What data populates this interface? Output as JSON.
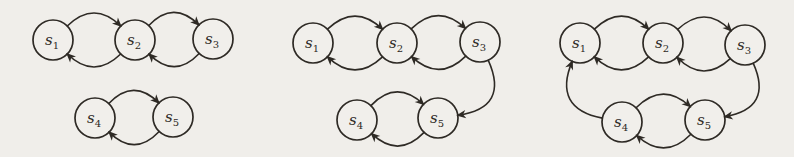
{
  "canvas": {
    "width": 794,
    "height": 157,
    "paper_color": "#f0eeea",
    "node_fill": "#f1efeb",
    "ink_color": "#2e2a25",
    "node_radius": 20,
    "edge_stroke_width": 1.6,
    "node_stroke_width": 1.7
  },
  "diagrams": [
    {
      "name": "graph-left",
      "nodes": [
        {
          "id": "s1",
          "label": "s",
          "sub": "1",
          "x": 53,
          "y": 40
        },
        {
          "id": "s2",
          "label": "s",
          "sub": "2",
          "x": 135,
          "y": 40
        },
        {
          "id": "s3",
          "label": "s",
          "sub": "3",
          "x": 213,
          "y": 39
        },
        {
          "id": "s4",
          "label": "s",
          "sub": "4",
          "x": 95,
          "y": 118
        },
        {
          "id": "s5",
          "label": "s",
          "sub": "5",
          "x": 173,
          "y": 117
        }
      ],
      "edges": [
        {
          "from": "s1",
          "to": "s2",
          "bend": 40
        },
        {
          "from": "s2",
          "to": "s1",
          "bend": 40
        },
        {
          "from": "s2",
          "to": "s3",
          "bend": 40
        },
        {
          "from": "s3",
          "to": "s2",
          "bend": 40
        },
        {
          "from": "s4",
          "to": "s5",
          "bend": 40
        },
        {
          "from": "s5",
          "to": "s4",
          "bend": 40
        }
      ]
    },
    {
      "name": "graph-middle",
      "nodes": [
        {
          "id": "s1",
          "label": "s",
          "sub": "1",
          "x": 313,
          "y": 43
        },
        {
          "id": "s2",
          "label": "s",
          "sub": "2",
          "x": 397,
          "y": 43
        },
        {
          "id": "s3",
          "label": "s",
          "sub": "3",
          "x": 480,
          "y": 42
        },
        {
          "id": "s4",
          "label": "s",
          "sub": "4",
          "x": 357,
          "y": 120
        },
        {
          "id": "s5",
          "label": "s",
          "sub": "5",
          "x": 438,
          "y": 118
        }
      ],
      "edges": [
        {
          "from": "s1",
          "to": "s2",
          "bend": 40
        },
        {
          "from": "s2",
          "to": "s1",
          "bend": 40
        },
        {
          "from": "s2",
          "to": "s3",
          "bend": 40
        },
        {
          "from": "s3",
          "to": "s2",
          "bend": 40
        },
        {
          "from": "s4",
          "to": "s5",
          "bend": 40
        },
        {
          "from": "s5",
          "to": "s4",
          "bend": 40
        },
        {
          "from": "s3",
          "to": "s5",
          "bend": 58
        }
      ]
    },
    {
      "name": "graph-right",
      "nodes": [
        {
          "id": "s1",
          "label": "s",
          "sub": "1",
          "x": 580,
          "y": 43
        },
        {
          "id": "s2",
          "label": "s",
          "sub": "2",
          "x": 663,
          "y": 43
        },
        {
          "id": "s3",
          "label": "s",
          "sub": "3",
          "x": 745,
          "y": 45
        },
        {
          "id": "s4",
          "label": "s",
          "sub": "4",
          "x": 622,
          "y": 122
        },
        {
          "id": "s5",
          "label": "s",
          "sub": "5",
          "x": 705,
          "y": 120
        }
      ],
      "edges": [
        {
          "from": "s1",
          "to": "s2",
          "bend": 40
        },
        {
          "from": "s2",
          "to": "s1",
          "bend": 40
        },
        {
          "from": "s2",
          "to": "s3",
          "bend": 40
        },
        {
          "from": "s3",
          "to": "s2",
          "bend": 40
        },
        {
          "from": "s4",
          "to": "s5",
          "bend": 40
        },
        {
          "from": "s5",
          "to": "s4",
          "bend": 40
        },
        {
          "from": "s3",
          "to": "s5",
          "bend": 55
        },
        {
          "from": "s4",
          "to": "s1",
          "bend": 55
        }
      ]
    }
  ]
}
